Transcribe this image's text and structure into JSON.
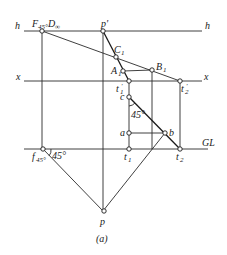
{
  "figure": {
    "caption": "(a)",
    "lines": {
      "h_label_left": "h",
      "h_label_right": "h",
      "x_label_left": "x",
      "x_label_right": "x",
      "gl_label": "GL"
    },
    "points": {
      "f_d": "F",
      "f_d_sub": "45°",
      "f_d_d": "D",
      "f_d_d_sub": "∞",
      "p_prime": "p'",
      "c1": "C",
      "c1_sub": "1",
      "a1": "A",
      "a1_sub": "1",
      "b1": "B",
      "b1_sub": "1",
      "t1_prime": "t",
      "t1_prime_sub": "1",
      "t1_prime_mark": "'",
      "t2_prime": "t",
      "t2_prime_sub": "2",
      "t2_prime_mark": "'",
      "c": "c",
      "a": "a",
      "b": "b",
      "t1": "t",
      "t1_sub": "1",
      "t2": "t",
      "t2_sub": "2",
      "f45": "f",
      "f45_sub": "45°",
      "p": "p"
    },
    "angles": {
      "angle_c": "45°",
      "angle_f": "45°"
    }
  }
}
